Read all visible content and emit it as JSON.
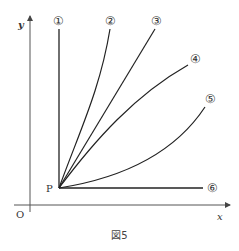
{
  "figure": {
    "caption": "図5",
    "axes": {
      "x_label": "x",
      "y_label": "y",
      "origin_label": "O"
    },
    "point": {
      "label": "P"
    },
    "curves": [
      {
        "id": 1,
        "label": "①",
        "shape": "vertical line"
      },
      {
        "id": 2,
        "label": "②",
        "shape": "steep curve bending right"
      },
      {
        "id": 3,
        "label": "③",
        "shape": "straight line"
      },
      {
        "id": 4,
        "label": "④",
        "shape": "curve concave down"
      },
      {
        "id": 5,
        "label": "⑤",
        "shape": "curve concave up"
      },
      {
        "id": 6,
        "label": "⑥",
        "shape": "horizontal line"
      }
    ]
  }
}
